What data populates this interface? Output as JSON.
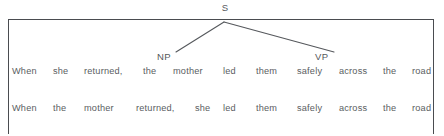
{
  "figure": {
    "type": "syntactic-parse-tree-diagram",
    "root_node": "S",
    "nodes": [
      {
        "label": "NP",
        "x": 157,
        "y": 51
      },
      {
        "label": "VP",
        "x": 315,
        "y": 51
      }
    ],
    "branches": [
      {
        "from": "S",
        "to": "NP",
        "x1": 224,
        "y1": 22,
        "x2": 176,
        "y2": 52
      },
      {
        "from": "S",
        "to": "VP",
        "x1": 224,
        "y1": 22,
        "x2": 334,
        "y2": 52
      }
    ],
    "frame_color": "#4a4c50",
    "text_color": "#5a5d61"
  },
  "rows": [
    {
      "name": "sentence-row-1",
      "sentence": "When she returned, the mother led them safely across the road",
      "words": [
        {
          "text": "When",
          "x": 4
        },
        {
          "text": "she",
          "x": 45
        },
        {
          "text": "returned,",
          "x": 76
        },
        {
          "text": "the",
          "x": 135
        },
        {
          "text": "mother",
          "x": 165
        },
        {
          "text": "led",
          "x": 215
        },
        {
          "text": "them",
          "x": 248
        },
        {
          "text": "safely",
          "x": 289
        },
        {
          "text": "across",
          "x": 331
        },
        {
          "text": "the",
          "x": 375
        },
        {
          "text": "road",
          "x": 404
        }
      ]
    },
    {
      "name": "sentence-row-2",
      "sentence": "When the mother returned, she led them safely across the road",
      "words": [
        {
          "text": "When",
          "x": 4
        },
        {
          "text": "the",
          "x": 45
        },
        {
          "text": "mother",
          "x": 76
        },
        {
          "text": "returned,",
          "x": 128
        },
        {
          "text": "she",
          "x": 187
        },
        {
          "text": "led",
          "x": 215
        },
        {
          "text": "them",
          "x": 248
        },
        {
          "text": "safely",
          "x": 289
        },
        {
          "text": "across",
          "x": 331
        },
        {
          "text": "the",
          "x": 375
        },
        {
          "text": "road",
          "x": 404
        }
      ]
    }
  ]
}
